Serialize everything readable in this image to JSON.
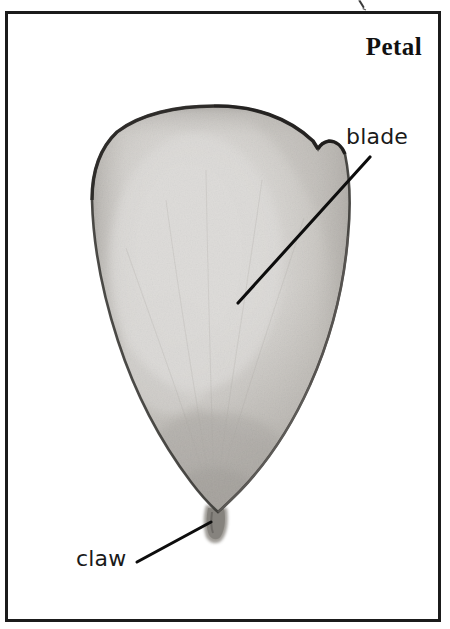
{
  "figure": {
    "title": "Petal",
    "kind": "botanical-pencil-illustration",
    "subject": "petal",
    "background_color": "#ffffff",
    "frame": {
      "border_color": "#1b1b1b",
      "border_width_px": 3
    }
  },
  "labels": {
    "blade": "blade",
    "claw": "claw"
  },
  "annotations": [
    {
      "id": "blade",
      "text": "blade",
      "leader_from": [
        370,
        157
      ],
      "leader_to": [
        238,
        303
      ],
      "text_position": [
        346,
        124
      ]
    },
    {
      "id": "claw",
      "text": "claw",
      "leader_from": [
        137,
        562
      ],
      "leader_to": [
        211,
        522
      ],
      "text_position": [
        76,
        546
      ]
    }
  ],
  "drawing": {
    "outline_color": "#2f2d2c",
    "shade_light": "#fdfdfc",
    "shade_mid": "#cfcdc9",
    "shade_dark": "#9a9792",
    "shade_edge": "#6e6b67",
    "claw_color": "#8d8a85",
    "notch_note": "small notch on upper-right margin of the blade"
  }
}
